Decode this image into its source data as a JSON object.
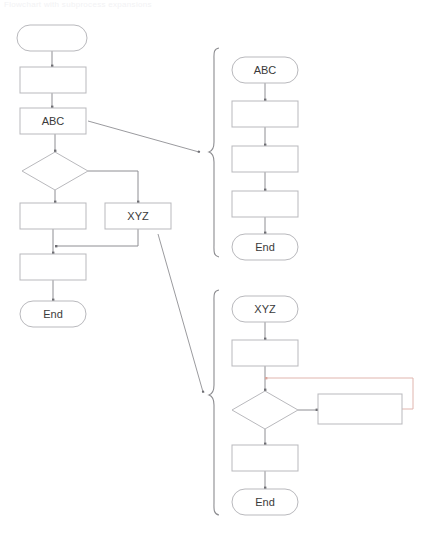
{
  "page": {
    "title_faint": "Flowchart with subprocess expansions",
    "background_color": "#ffffff",
    "width": 423,
    "height": 533
  },
  "style": {
    "shape_stroke": "#b9b9bd",
    "shape_fill": "#ffffff",
    "connector_stroke": "#8e8e93",
    "arrow_fill": "#6e6e73",
    "brace_stroke": "#8c8c90",
    "label_color": "#3a3a3a",
    "loop_line_color": "#e6b9b3",
    "loop_line_color_right": "#c8d6cc"
  },
  "main_flow": {
    "name": "main-flowchart",
    "nodes": [
      {
        "id": "start",
        "type": "terminator",
        "label": "",
        "x": 17,
        "y": 25,
        "w": 70,
        "h": 26
      },
      {
        "id": "process1",
        "type": "process",
        "label": "",
        "x": 20,
        "y": 67,
        "w": 66,
        "h": 26
      },
      {
        "id": "abc",
        "type": "process",
        "label": "ABC",
        "x": 20,
        "y": 108,
        "w": 66,
        "h": 26
      },
      {
        "id": "decision",
        "type": "decision",
        "label": "",
        "x": 22,
        "y": 152,
        "w": 66,
        "h": 38
      },
      {
        "id": "processLeft",
        "type": "process",
        "label": "",
        "x": 20,
        "y": 203,
        "w": 66,
        "h": 26
      },
      {
        "id": "xyz",
        "type": "process",
        "label": "XYZ",
        "x": 105,
        "y": 203,
        "w": 66,
        "h": 26
      },
      {
        "id": "process2",
        "type": "process",
        "label": "",
        "x": 20,
        "y": 254,
        "w": 66,
        "h": 26
      },
      {
        "id": "end",
        "type": "terminator",
        "label": "End",
        "x": 20,
        "y": 301,
        "w": 66,
        "h": 26
      }
    ]
  },
  "abc_subflow": {
    "name": "abc-subflowchart",
    "brace": {
      "x": 211,
      "y_top": 48,
      "y_bottom": 258
    },
    "nodes": [
      {
        "id": "abc-start",
        "type": "terminator",
        "label": "ABC",
        "x": 232,
        "y": 57,
        "w": 66,
        "h": 26
      },
      {
        "id": "abc-p1",
        "type": "process",
        "label": "",
        "x": 232,
        "y": 101,
        "w": 66,
        "h": 26
      },
      {
        "id": "abc-p2",
        "type": "process",
        "label": "",
        "x": 232,
        "y": 146,
        "w": 66,
        "h": 26
      },
      {
        "id": "abc-p3",
        "type": "process",
        "label": "",
        "x": 232,
        "y": 191,
        "w": 66,
        "h": 26
      },
      {
        "id": "abc-end",
        "type": "terminator",
        "label": "End",
        "x": 232,
        "y": 234,
        "w": 66,
        "h": 26
      }
    ]
  },
  "xyz_subflow": {
    "name": "xyz-subflowchart",
    "brace": {
      "x": 211,
      "y_top": 290,
      "y_bottom": 515
    },
    "nodes": [
      {
        "id": "xyz-start",
        "type": "terminator",
        "label": "XYZ",
        "x": 232,
        "y": 296,
        "w": 66,
        "h": 26
      },
      {
        "id": "xyz-p1",
        "type": "process",
        "label": "",
        "x": 232,
        "y": 340,
        "w": 66,
        "h": 26
      },
      {
        "id": "xyz-decision",
        "type": "decision",
        "label": "",
        "x": 232,
        "y": 391,
        "w": 66,
        "h": 38
      },
      {
        "id": "xyz-loop",
        "type": "process",
        "label": "",
        "x": 318,
        "y": 394,
        "w": 84,
        "h": 30
      },
      {
        "id": "xyz-p2",
        "type": "process",
        "label": "",
        "x": 232,
        "y": 445,
        "w": 66,
        "h": 26
      },
      {
        "id": "xyz-end",
        "type": "terminator",
        "label": "End",
        "x": 232,
        "y": 489,
        "w": 66,
        "h": 26
      }
    ]
  },
  "expansion_links": [
    {
      "id": "abc-link",
      "from": "abc-box-right",
      "to": "abc-brace",
      "x1": 88,
      "y1": 121,
      "x2": 200,
      "y2": 152
    },
    {
      "id": "xyz-link",
      "from": "xyz-box-bottom",
      "to": "xyz-brace",
      "x1": 157,
      "y1": 233,
      "x2": 204,
      "y2": 392
    }
  ]
}
